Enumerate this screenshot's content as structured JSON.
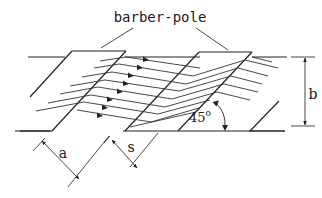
{
  "diagram": {
    "title_label": "barber-pole",
    "dimension_labels": {
      "a": "a",
      "s": "s",
      "b": "b",
      "angle": "45",
      "angle_unit": "o"
    },
    "colors": {
      "line": "#222222",
      "background": "#ffffff"
    },
    "elements": {
      "top_edge": "strip top edge",
      "bottom_edge": "strip bottom edge",
      "barber_pole_stripes": 2,
      "current_lines_with_arrows": 8,
      "angle_between_stripe_and_edge": "45°"
    }
  }
}
